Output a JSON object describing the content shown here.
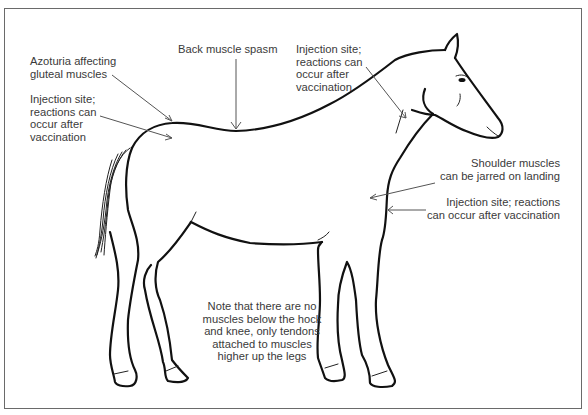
{
  "diagram": {
    "colors": {
      "outline": "#111111",
      "label_text": "#3a3a3a",
      "leader_line": "#555555",
      "frame": "#6a6a6a"
    },
    "labels": [
      {
        "id": "azoturia",
        "text": "Azoturia affecting\ngluteal muscles"
      },
      {
        "id": "injection_rump",
        "text": "Injection site;\nreactions can\noccur after\nvaccination"
      },
      {
        "id": "back_spasm",
        "text": "Back muscle spasm"
      },
      {
        "id": "injection_neck",
        "text": "Injection site;\nreactions can\noccur after\nvaccination"
      },
      {
        "id": "shoulder",
        "text": "Shoulder muscles\ncan be jarred on landing"
      },
      {
        "id": "injection_chest",
        "text": "Injection site; reactions\ncan occur after vaccination"
      },
      {
        "id": "note",
        "text": "Note that there are no\nmuscles below the hock\nand knee, only tendons\nattached to muscles\nhigher up the legs"
      }
    ]
  }
}
